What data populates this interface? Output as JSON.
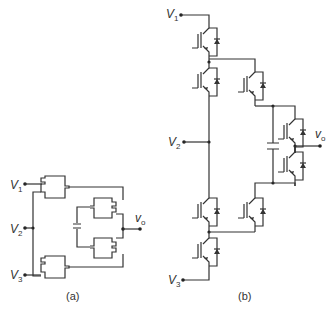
{
  "figure": {
    "panel_a": {
      "caption": "(a)",
      "labels": {
        "v1": {
          "main": "V",
          "sub": "1"
        },
        "v2": {
          "main": "V",
          "sub": "2"
        },
        "v3": {
          "main": "V",
          "sub": "3"
        },
        "vo": {
          "main": "v",
          "sub": "o"
        }
      }
    },
    "panel_b": {
      "caption": "(b)",
      "labels": {
        "v1": {
          "main": "V",
          "sub": "1"
        },
        "v2": {
          "main": "V",
          "sub": "2"
        },
        "v3": {
          "main": "V",
          "sub": "3"
        },
        "vo": {
          "main": "v",
          "sub": "o"
        }
      }
    }
  }
}
